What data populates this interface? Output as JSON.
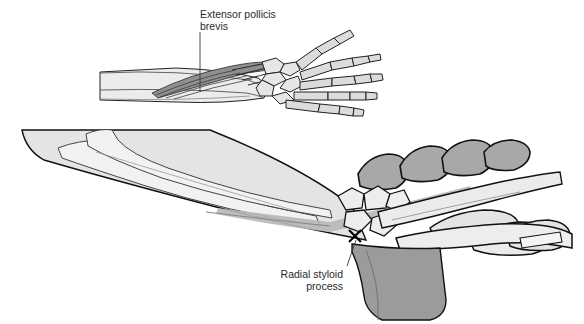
{
  "figure": {
    "background_color": "#ffffff",
    "outline_color": "#000000",
    "panels": [
      {
        "id": "upper-panel",
        "description": "Dorsal view of forearm and hand skeleton showing extensor pollicis brevis muscle and tendon",
        "label": {
          "line1": "Extensor pollicis",
          "line2": "brevis",
          "text_anchor": "start",
          "leader_from_x": 200,
          "leader_from_y": 30,
          "leader_to_x": 200,
          "leader_to_y": 92
        }
      },
      {
        "id": "lower-panel",
        "description": "Lateral view of forearm and hand skeleton with radial styloid process marked by an X",
        "marker": {
          "glyph": "X",
          "x": 355,
          "y": 236,
          "color": "#000000"
        },
        "label": {
          "line1": "Radial styloid",
          "line2": "process",
          "text_anchor": "end",
          "leader_from_x": 346,
          "leader_from_y": 264,
          "leader_to_x": 356,
          "leader_to_y": 240
        }
      }
    ],
    "colors": {
      "bone_light": "#e9e9e9",
      "bone_lighter": "#f2f2f2",
      "skin_shadow": "#e2e2e2",
      "muscle_dark": "#6e6e6e",
      "tendon_grey": "#b4b4b4",
      "metacarpal_dark": "#a8a8a8",
      "palm_mass": "#9b9b9b",
      "outline": "#111111",
      "label": "#2b2b2b"
    }
  }
}
